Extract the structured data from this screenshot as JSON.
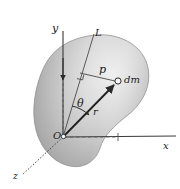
{
  "figure": {
    "background_color": "#ffffff",
    "stroke_color": "#333333",
    "body": {
      "name": "rigid-body-blob",
      "fill_light": "#e9e9e9",
      "fill_mid": "#c8c8c8",
      "fill_dark": "#9d9d9d",
      "outline_color": "#8a8a8a"
    },
    "labels": {
      "y_axis": "y",
      "x_axis": "x",
      "z_axis": "z",
      "origin": "O",
      "axis_line": "L",
      "perpendicular_distance": "p",
      "mass_element": "dm",
      "position_vector": "r",
      "angle": "θ"
    },
    "icons": {
      "origin_marker": "small-open-circle",
      "mass_point_marker": "small-open-circle",
      "right_angle_marker": "right-angle-square",
      "arrowhead": "solid-triangle-arrowhead"
    },
    "geometry": {
      "origin": [
        63,
        137
      ],
      "x_axis_end": [
        176,
        137
      ],
      "y_axis_top": [
        63,
        31
      ],
      "z_axis_end": [
        18,
        178
      ],
      "line_L_top": [
        93,
        33
      ],
      "mass_point": [
        118,
        82
      ],
      "foot_of_perpendicular": [
        79,
        73
      ],
      "p_segment": [
        [
          79,
          73
        ],
        [
          118,
          82
        ]
      ],
      "r_vector": [
        [
          63,
          137
        ],
        [
          118,
          82
        ]
      ],
      "dashed_vertical": [
        [
          63,
          81
        ],
        [
          63,
          137
        ]
      ],
      "dashed_horizontal": [
        [
          63,
          137
        ],
        [
          119,
          137
        ]
      ]
    }
  }
}
